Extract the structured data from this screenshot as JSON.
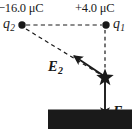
{
  "figure": {
    "background_color": "#ffffff",
    "stroke_color": "#1a1a1a",
    "width": 132,
    "height": 129
  },
  "charges": [
    {
      "id": "q2",
      "name": "q",
      "subscript": "2",
      "value_label": "−16.0 μC",
      "sign": "negative",
      "magnitude": 16.0,
      "unit": "μC",
      "x": 22,
      "y": 25
    },
    {
      "id": "q1",
      "name": "q",
      "subscript": "1",
      "value_label": "+4.0 μC",
      "sign": "positive",
      "magnitude": 4.0,
      "unit": "μC",
      "x": 106,
      "y": 25
    }
  ],
  "field_point": {
    "marker": "star-marker",
    "x": 105,
    "y": 77
  },
  "vectors": [
    {
      "id": "E1",
      "name": "E",
      "subscript": "1",
      "label": "E",
      "direction": "down",
      "from_x": 105,
      "from_y": 77,
      "to_x": 105,
      "to_y": 121,
      "source_charge": "q1",
      "style": "solid"
    },
    {
      "id": "E2",
      "name": "E",
      "subscript": "2",
      "label": "E",
      "direction": "up-left",
      "from_x": 105,
      "from_y": 77,
      "to_x": 70,
      "to_y": 54,
      "source_charge": "q2",
      "style": "solid"
    }
  ],
  "guide_lines": [
    {
      "id": "q2-q1-baseline",
      "style": "dashed",
      "from_x": 26,
      "from_y": 25,
      "to_x": 102,
      "to_y": 25
    },
    {
      "id": "q1-vertical-guide",
      "style": "dashed",
      "from_x": 105,
      "from_y": 29,
      "to_x": 105,
      "to_y": 75
    },
    {
      "id": "q2-diagonal-guide",
      "style": "dashed",
      "from_x": 26,
      "from_y": 29,
      "to_x": 103,
      "to_y": 76
    }
  ]
}
